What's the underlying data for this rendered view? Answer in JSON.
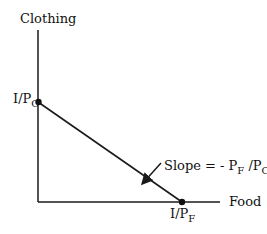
{
  "diagram": {
    "y_axis_label": "Clothing",
    "x_axis_label": "Food",
    "y_intercept": {
      "base": "I/P",
      "sub": "C"
    },
    "x_intercept": {
      "base": "I/P",
      "sub": "F"
    },
    "slope_annotation": {
      "prefix": "Slope = - P",
      "sub1": "F",
      "mid": " /P",
      "sub2": "C"
    },
    "colors": {
      "line": "#1a1a1a",
      "background": "#ffffff"
    }
  }
}
